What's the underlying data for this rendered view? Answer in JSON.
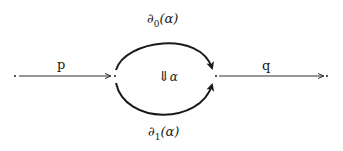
{
  "diagram": {
    "type": "2-cell (globular) diagram",
    "colors": {
      "stroke": "#1a1a1a",
      "background": "#ffffff"
    },
    "nodes": [
      {
        "id": "left",
        "x": 15,
        "y": 76
      },
      {
        "id": "mid-left",
        "x": 115,
        "y": 76
      },
      {
        "id": "mid-right",
        "x": 216,
        "y": 76
      },
      {
        "id": "right",
        "x": 327,
        "y": 76
      }
    ],
    "edges": [
      {
        "id": "p",
        "label": "p",
        "from": "left",
        "to": "mid-left",
        "style": "thin arrow"
      },
      {
        "id": "d0",
        "label_symbol": "∂",
        "label_sub": "0",
        "label_arg": "(α)",
        "from": "mid-left",
        "to": "mid-right",
        "style": "upper arc, bold arrow"
      },
      {
        "id": "d1",
        "label_symbol": "∂",
        "label_sub": "1",
        "label_arg": "(α)",
        "from": "mid-left",
        "to": "mid-right",
        "style": "lower arc, bold arrow"
      },
      {
        "id": "q",
        "label": "q",
        "from": "mid-right",
        "to": "right",
        "style": "thin arrow"
      }
    ],
    "two_cell": {
      "arrow": "⇓",
      "label": "α"
    }
  }
}
